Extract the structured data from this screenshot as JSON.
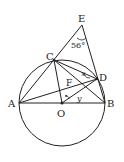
{
  "diagram": {
    "type": "geometry",
    "points": {
      "A": {
        "label": "A",
        "x": 19,
        "y": 103
      },
      "B": {
        "label": "B",
        "x": 105,
        "y": 103
      },
      "O": {
        "label": "O",
        "x": 62,
        "y": 103
      },
      "C": {
        "label": "C",
        "x": 54,
        "y": 60
      },
      "D": {
        "label": "D",
        "x": 97,
        "y": 79
      },
      "E": {
        "label": "E",
        "x": 82,
        "y": 25
      },
      "F": {
        "label": "F",
        "x": 72,
        "y": 83
      }
    },
    "circle": {
      "center": "O",
      "radius": 43
    },
    "angles": {
      "E": {
        "label": "56°"
      },
      "x": {
        "label": "x"
      },
      "y": {
        "label": "y"
      }
    },
    "colors": {
      "stroke": "#222222",
      "background": "#ffffff"
    }
  }
}
